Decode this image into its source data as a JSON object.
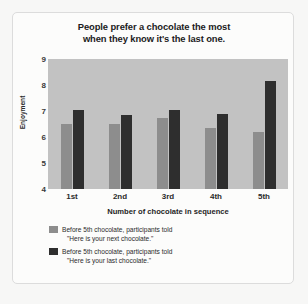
{
  "chart_data": {
    "type": "bar",
    "title": "People prefer a chocolate the most when they know it's the last one.",
    "title_line1": "People prefer a chocolate the most",
    "title_line2": "when they know it's the last one.",
    "xlabel": "Number of chocolate in sequence",
    "ylabel": "Enjoyment",
    "categories": [
      "1st",
      "2nd",
      "3rd",
      "4th",
      "5th"
    ],
    "yticks": [
      4,
      5,
      6,
      7,
      8,
      9
    ],
    "ylim": [
      4,
      9
    ],
    "grid": false,
    "legend_position": "below",
    "series": [
      {
        "name": "Before 5th chocolate, participants told \"Here is your next chocolate.\"",
        "name_line1": "Before 5th chocolate, participants told",
        "name_line2": "\"Here is your next chocolate.\"",
        "color": "#8d8d8d",
        "values": [
          6.5,
          6.5,
          6.75,
          6.35,
          6.2
        ]
      },
      {
        "name": "Before 5th chocolate, participants told \"Here is your last chocolate.\"",
        "name_line1": "Before 5th chocolate, participants told",
        "name_line2": "\"Here is your last chocolate.\"",
        "color": "#2e2e2e",
        "values": [
          7.05,
          6.85,
          7.05,
          6.9,
          8.15
        ]
      }
    ],
    "plot_background": "#c2c2c2"
  }
}
